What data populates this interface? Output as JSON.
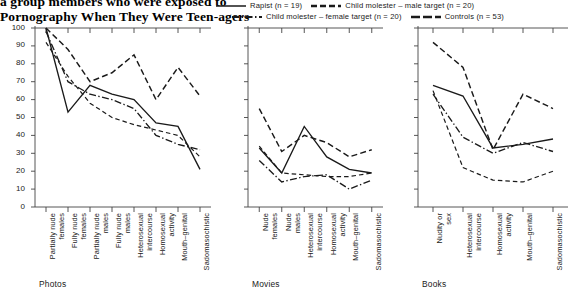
{
  "title": {
    "line1": "a group members who were exposed to",
    "line2": "Pornography When They Were Teen-agers"
  },
  "legend": {
    "items": [
      {
        "label": "Rapist (n = 19)",
        "style": "solid",
        "name": "rapist"
      },
      {
        "label": "Child molester – male target (n = 20)",
        "style": "dashed-thick",
        "name": "child-molester-male-target"
      },
      {
        "label": "Child molester – female target (n = 20)",
        "style": "dash-dot",
        "name": "child-molester-female-target"
      },
      {
        "label": "Controls (n = 53)",
        "style": "dashed-long",
        "name": "controls"
      }
    ]
  },
  "axis": {
    "y_ticks": [
      0,
      10,
      20,
      30,
      40,
      50,
      60,
      70,
      80,
      90,
      100
    ],
    "y_min": 0,
    "y_max": 100
  },
  "panels": [
    {
      "name": "photos",
      "caption": "Photos"
    },
    {
      "name": "movies",
      "caption": "Movies"
    },
    {
      "name": "books",
      "caption": "Books"
    }
  ],
  "chart_data": {
    "type": "line",
    "title": "Pornography When They Were Teen-agers",
    "xlabel": "",
    "ylabel": "",
    "ylim": [
      0,
      100
    ],
    "yticks": [
      0,
      10,
      20,
      30,
      40,
      50,
      60,
      70,
      80,
      90,
      100
    ],
    "grid": false,
    "legend_position": "top-right",
    "legend": [
      "Rapist (n = 19)",
      "Child molester – male target (n = 20)",
      "Child molester – female target (n = 20)",
      "Controls (n = 53)"
    ],
    "panels": [
      {
        "name": "Photos",
        "categories": [
          "Partially nude females",
          "Fully nude females",
          "Partially nude males",
          "Fully nude males",
          "Heterosexual intercourse",
          "Homosexual activity",
          "Mouth–genital",
          "Sadomasochistic"
        ],
        "series": [
          {
            "name": "Rapist (n = 19)",
            "values": [
              100,
              53,
              68,
              63,
              60,
              47,
              45,
              21
            ]
          },
          {
            "name": "Child molester – male target (n = 20)",
            "values": [
              100,
              88,
              70,
              75,
              85,
              60,
              78,
              62
            ]
          },
          {
            "name": "Child molester – female target (n = 20)",
            "values": [
              98,
              70,
              63,
              60,
              55,
              40,
              35,
              32
            ]
          },
          {
            "name": "Controls (n = 53)",
            "values": [
              92,
              73,
              58,
              50,
              46,
              43,
              40,
              28
            ]
          }
        ]
      },
      {
        "name": "Movies",
        "categories": [
          "Nude females",
          "Nude males",
          "Heterosexual intercourse",
          "Homosexual activity",
          "Mouth–genital",
          "Sadomasochistic"
        ],
        "series": [
          {
            "name": "Rapist (n = 19)",
            "values": [
              33,
              19,
              45,
              28,
              21,
              19
            ]
          },
          {
            "name": "Child molester – male target (n = 20)",
            "values": [
              55,
              31,
              40,
              36,
              28,
              32
            ]
          },
          {
            "name": "Child molester – female target (n = 20)",
            "values": [
              26,
              14,
              17,
              18,
              10,
              15
            ]
          },
          {
            "name": "Controls (n = 53)",
            "values": [
              34,
              19,
              18,
              17,
              17,
              19
            ]
          }
        ]
      },
      {
        "name": "Books",
        "categories": [
          "Nudity or sex",
          "Heterosexual intercourse",
          "Homosexual activity",
          "Mouth–genital",
          "Sadomasochistic"
        ],
        "series": [
          {
            "name": "Rapist (n = 19)",
            "values": [
              68,
              62,
              33,
              35,
              38
            ]
          },
          {
            "name": "Child molester – male target (n = 20)",
            "values": [
              92,
              78,
              32,
              63,
              55
            ]
          },
          {
            "name": "Child molester – female target (n = 20)",
            "values": [
              63,
              39,
              30,
              36,
              31
            ]
          },
          {
            "name": "Controls (n = 53)",
            "values": [
              65,
              22,
              15,
              14,
              20
            ]
          }
        ]
      }
    ]
  }
}
